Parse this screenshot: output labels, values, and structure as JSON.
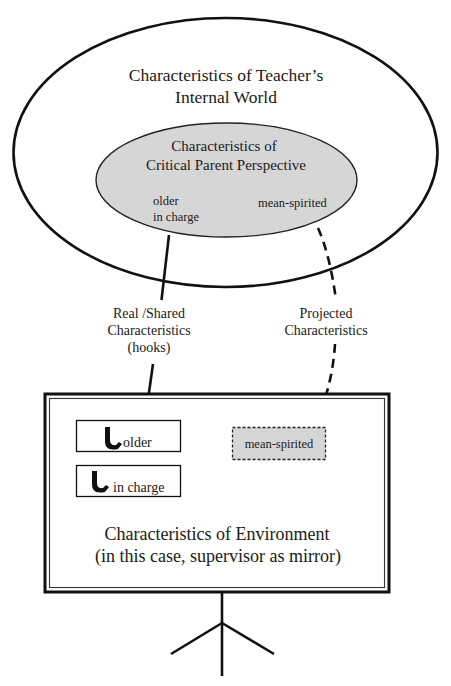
{
  "diagram": {
    "outer_ellipse": {
      "title_line1": "Characteristics of Teacher’s",
      "title_line2": "Internal World"
    },
    "inner_ellipse": {
      "title_line1": "Characteristics of",
      "title_line2": "Critical Parent Perspective",
      "traits_left_line1": "older",
      "traits_left_line2": "in charge",
      "traits_right": "mean-spirited",
      "fill_color": "#d6d6d6"
    },
    "connectors": {
      "real_label_line1": "Real /Shared",
      "real_label_line2": "Characteristics",
      "real_label_line3": "(hooks)",
      "projected_label_line1": "Projected",
      "projected_label_line2": "Characteristics"
    },
    "environment": {
      "hooks": [
        {
          "label": "older",
          "icon": "hook-icon"
        },
        {
          "label": "in charge",
          "icon": "hook-icon"
        }
      ],
      "projected_box": {
        "label": "mean-spirited",
        "fill_color": "#d6d6d6"
      },
      "title_line1": "Characteristics of Environment",
      "title_line2": "(in this case, supervisor as mirror)"
    },
    "colors": {
      "stroke": "#111111",
      "background": "#ffffff",
      "gray_fill": "#d6d6d6"
    }
  }
}
